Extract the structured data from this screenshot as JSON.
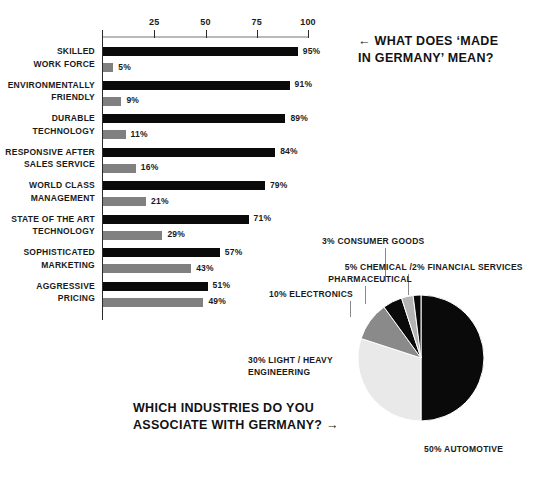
{
  "chart_data": [
    {
      "type": "bar",
      "title": "WHAT DOES 'MADE IN GERMANY' MEAN?",
      "orientation": "horizontal",
      "xlabel": "",
      "ylabel": "",
      "xlim": [
        0,
        100
      ],
      "ticks": [
        25,
        50,
        75,
        100
      ],
      "grid": false,
      "legend": "none",
      "series": [
        {
          "name": "agree",
          "color": "#0a0a0a"
        },
        {
          "name": "disagree",
          "color": "#808080"
        }
      ],
      "categories": [
        "SKILLED WORK FORCE",
        "ENVIRONMENTALLY FRIENDLY",
        "DURABLE TECHNOLOGY",
        "RESPONSIVE AFTER SALES SERVICE",
        "WORLD CLASS MANAGEMENT",
        "STATE OF THE ART TECHNOLOGY",
        "SOPHISTICATED MARKETING",
        "AGGRESSIVE PRICING"
      ],
      "rows": [
        {
          "line1": "SKILLED",
          "line2": "WORK FORCE",
          "primary": 95,
          "secondary": 5,
          "primary_label": "95%",
          "secondary_label": "5%"
        },
        {
          "line1": "ENVIRONMENTALLY",
          "line2": "FRIENDLY",
          "primary": 91,
          "secondary": 9,
          "primary_label": "91%",
          "secondary_label": "9%"
        },
        {
          "line1": "DURABLE",
          "line2": "TECHNOLOGY",
          "primary": 89,
          "secondary": 11,
          "primary_label": "89%",
          "secondary_label": "11%"
        },
        {
          "line1": "RESPONSIVE AFTER",
          "line2": "SALES SERVICE",
          "primary": 84,
          "secondary": 16,
          "primary_label": "84%",
          "secondary_label": "16%"
        },
        {
          "line1": "WORLD CLASS",
          "line2": "MANAGEMENT",
          "primary": 79,
          "secondary": 21,
          "primary_label": "79%",
          "secondary_label": "21%"
        },
        {
          "line1": "STATE OF THE ART",
          "line2": "TECHNOLOGY",
          "primary": 71,
          "secondary": 29,
          "primary_label": "71%",
          "secondary_label": "29%"
        },
        {
          "line1": "SOPHISTICATED",
          "line2": "MARKETING",
          "primary": 57,
          "secondary": 43,
          "primary_label": "57%",
          "secondary_label": "43%"
        },
        {
          "line1": "AGGRESSIVE",
          "line2": "PRICING",
          "primary": 51,
          "secondary": 49,
          "primary_label": "51%",
          "secondary_label": "49%"
        }
      ]
    },
    {
      "type": "pie",
      "title": "WHICH INDUSTRIES DO YOU ASSOCIATE WITH GERMANY?",
      "legend": "callout-labels",
      "labels": [
        "50% AUTOMOTIVE",
        "30% LIGHT / HEAVY ENGINEERING",
        "10% ELECTRONICS",
        "5% CHEMICAL / PHARMACEUTICAL",
        "3% CONSUMER GOODS",
        "2% FINANCIAL SERVICES"
      ],
      "values": [
        50,
        30,
        10,
        5,
        3,
        2
      ],
      "slices": [
        {
          "name": "AUTOMOTIVE",
          "value": 50,
          "label": "50% AUTOMOTIVE",
          "color": "#0a0a0a"
        },
        {
          "name": "LIGHT / HEAVY ENGINEERING",
          "value": 30,
          "label_line1": "30% LIGHT / HEAVY",
          "label_line2": "ENGINEERING",
          "color": "#e9e9e9"
        },
        {
          "name": "ELECTRONICS",
          "value": 10,
          "label": "10% ELECTRONICS",
          "color": "#8a8a8a"
        },
        {
          "name": "CHEMICAL / PHARMACEUTICAL",
          "value": 5,
          "label_line1": "5% CHEMICAL /",
          "label_line2": "PHARMACEUTICAL",
          "color": "#0a0a0a"
        },
        {
          "name": "CONSUMER GOODS",
          "value": 3,
          "label": "3% CONSUMER GOODS",
          "color": "#b4b4b4"
        },
        {
          "name": "FINANCIAL SERVICES",
          "value": 2,
          "label": "2% FINANCIAL SERVICES",
          "color": "#0a0a0a"
        }
      ]
    }
  ],
  "bar": {
    "axis": {
      "tick_labels": [
        "25",
        "50",
        "75",
        "100"
      ]
    }
  },
  "headlines": {
    "made_in_germany_line1": "← WHAT DOES ‘MADE",
    "made_in_germany_line2": "IN GERMANY’ MEAN?",
    "industries_line1": "WHICH INDUSTRIES DO YOU",
    "industries_line2": "ASSOCIATE WITH GERMANY? →"
  },
  "colors": {
    "background": "#ffffff",
    "text": "#1a1a1a",
    "bar_primary": "#0a0a0a",
    "bar_secondary": "#808080",
    "axis": "#2b2b2b",
    "rule": "#b9b9b9",
    "pie_dark": "#0a0a0a",
    "pie_mid": "#8a8a8a",
    "pie_light": "#e9e9e9",
    "pie_consumer": "#b4b4b4"
  }
}
